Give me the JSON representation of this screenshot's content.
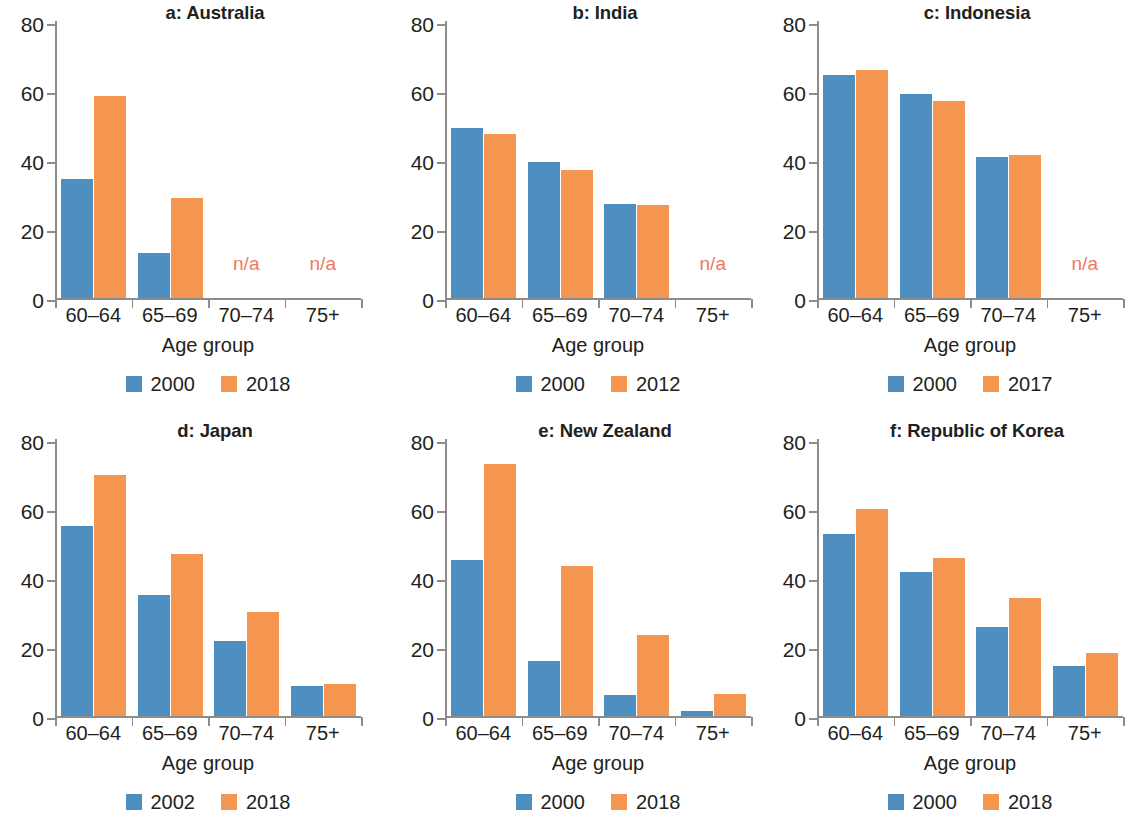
{
  "figure": {
    "axis_title": "Age group",
    "y_ticks": [
      0,
      20,
      40,
      60,
      80
    ],
    "categories": [
      "60–64",
      "65–69",
      "70–74",
      "75+"
    ],
    "na_label": "n/a",
    "colors": {
      "series0": "#4e8fc0",
      "series1": "#f4964f",
      "na_text": "#f2775a",
      "axis": "#8d8c8c"
    }
  },
  "chart_data": [
    {
      "type": "bar",
      "title": "a: Australia",
      "xlabel": "Age group",
      "ylabel": "",
      "ylim": [
        0,
        80
      ],
      "yticks": [
        0,
        20,
        40,
        60,
        80
      ],
      "grid": false,
      "legend_position": "bottom",
      "categories": [
        "60–64",
        "65–69",
        "70–74",
        "75+"
      ],
      "series": [
        {
          "name": "2000",
          "values": [
            34.5,
            13.2,
            null,
            null
          ]
        },
        {
          "name": "2018",
          "values": [
            58.7,
            29.0,
            null,
            null
          ]
        }
      ],
      "annotations": [
        {
          "text": "n/a",
          "category": "70–74"
        },
        {
          "text": "n/a",
          "category": "75+"
        }
      ]
    },
    {
      "type": "bar",
      "title": "b: India",
      "xlabel": "Age group",
      "ylabel": "",
      "ylim": [
        0,
        80
      ],
      "yticks": [
        0,
        20,
        40,
        60,
        80
      ],
      "grid": false,
      "legend_position": "bottom",
      "categories": [
        "60–64",
        "65–69",
        "70–74",
        "75+"
      ],
      "series": [
        {
          "name": "2000",
          "values": [
            49.3,
            39.6,
            27.3,
            null
          ]
        },
        {
          "name": "2012",
          "values": [
            47.6,
            37.2,
            27.0,
            null
          ]
        }
      ],
      "annotations": [
        {
          "text": "n/a",
          "category": "75+"
        }
      ]
    },
    {
      "type": "bar",
      "title": "c: Indonesia",
      "xlabel": "Age group",
      "ylabel": "",
      "ylim": [
        0,
        80
      ],
      "yticks": [
        0,
        20,
        40,
        60,
        80
      ],
      "grid": false,
      "legend_position": "bottom",
      "categories": [
        "60–64",
        "65–69",
        "70–74",
        "75+"
      ],
      "series": [
        {
          "name": "2000",
          "values": [
            64.8,
            59.3,
            41.0,
            null
          ]
        },
        {
          "name": "2017",
          "values": [
            66.3,
            57.2,
            41.5,
            null
          ]
        }
      ],
      "annotations": [
        {
          "text": "n/a",
          "category": "75+"
        }
      ]
    },
    {
      "type": "bar",
      "title": "d: Japan",
      "xlabel": "Age group",
      "ylabel": "",
      "ylim": [
        0,
        80
      ],
      "yticks": [
        0,
        20,
        40,
        60,
        80
      ],
      "grid": false,
      "legend_position": "bottom",
      "categories": [
        "60–64",
        "65–69",
        "70–74",
        "75+"
      ],
      "series": [
        {
          "name": "2002",
          "values": [
            55.2,
            35.3,
            22.0,
            8.7
          ]
        },
        {
          "name": "2018",
          "values": [
            69.9,
            47.1,
            30.4,
            9.5
          ]
        }
      ],
      "annotations": []
    },
    {
      "type": "bar",
      "title": "e: New Zealand",
      "xlabel": "Age group",
      "ylabel": "",
      "ylim": [
        0,
        80
      ],
      "yticks": [
        0,
        20,
        40,
        60,
        80
      ],
      "grid": false,
      "legend_position": "bottom",
      "categories": [
        "60–64",
        "65–69",
        "70–74",
        "75+"
      ],
      "series": [
        {
          "name": "2000",
          "values": [
            45.2,
            16.0,
            6.1,
            1.6
          ]
        },
        {
          "name": "2018",
          "values": [
            73.2,
            43.6,
            23.5,
            6.5
          ]
        }
      ],
      "annotations": []
    },
    {
      "type": "bar",
      "title": "f: Republic of Korea",
      "xlabel": "Age group",
      "ylabel": "",
      "ylim": [
        0,
        80
      ],
      "yticks": [
        0,
        20,
        40,
        60,
        80
      ],
      "grid": false,
      "legend_position": "bottom",
      "categories": [
        "60–64",
        "65–69",
        "70–74",
        "75+"
      ],
      "series": [
        {
          "name": "2000",
          "values": [
            53.0,
            42.0,
            26.0,
            14.5
          ]
        },
        {
          "name": "2018",
          "values": [
            60.0,
            46.0,
            34.4,
            18.4
          ]
        }
      ],
      "annotations": []
    }
  ]
}
